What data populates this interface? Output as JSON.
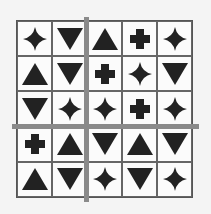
{
  "grid": {
    "rows": 5,
    "cols": 5,
    "fill_color": "#222222",
    "divider_color": "#8a8a8a",
    "cells": [
      [
        "star4",
        "triangle-down",
        "triangle-up",
        "cross",
        "star4"
      ],
      [
        "triangle-up",
        "triangle-down",
        "cross",
        "star4",
        "triangle-down"
      ],
      [
        "triangle-down",
        "star4",
        "star4",
        "cross",
        "star4"
      ],
      [
        "cross",
        "triangle-up",
        "triangle-down",
        "triangle-up",
        "triangle-down"
      ],
      [
        "triangle-up",
        "triangle-down",
        "star4",
        "triangle-down",
        "star4"
      ]
    ],
    "dividers": {
      "vertical_after_col": 2,
      "horizontal_after_row": 3
    }
  }
}
